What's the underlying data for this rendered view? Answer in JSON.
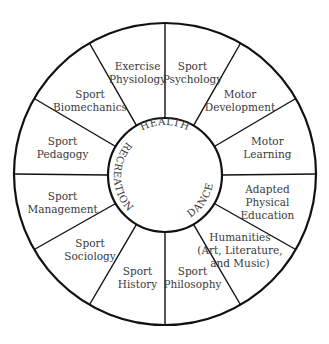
{
  "diagram": {
    "type": "circular-wheel",
    "center_labels": [
      {
        "text": "HEALTH",
        "position": "top"
      },
      {
        "text": "RECREATION",
        "position": "left"
      },
      {
        "text": "DANCE",
        "position": "lower-right"
      }
    ],
    "segments": [
      {
        "lines": [
          "Sport",
          "Psychology"
        ]
      },
      {
        "lines": [
          "Motor",
          "Development"
        ]
      },
      {
        "lines": [
          "Motor",
          "Learning"
        ]
      },
      {
        "lines": [
          "Adapted",
          "Physical",
          "Education"
        ]
      },
      {
        "lines": [
          "Humanities",
          "(Art, Literature,",
          "and Music)"
        ]
      },
      {
        "lines": [
          "Sport",
          "Philosophy"
        ]
      },
      {
        "lines": [
          "Sport",
          "History"
        ]
      },
      {
        "lines": [
          "Sport",
          "Sociology"
        ]
      },
      {
        "lines": [
          "Sport",
          "Management"
        ]
      },
      {
        "lines": [
          "Sport",
          "Pedagogy"
        ]
      },
      {
        "lines": [
          "Sport",
          "Biomechanics"
        ]
      },
      {
        "lines": [
          "Exercise",
          "Physiology"
        ]
      }
    ],
    "colors": {
      "line": "#111111",
      "text": "#3a3a3a",
      "background": "#ffffff"
    }
  }
}
